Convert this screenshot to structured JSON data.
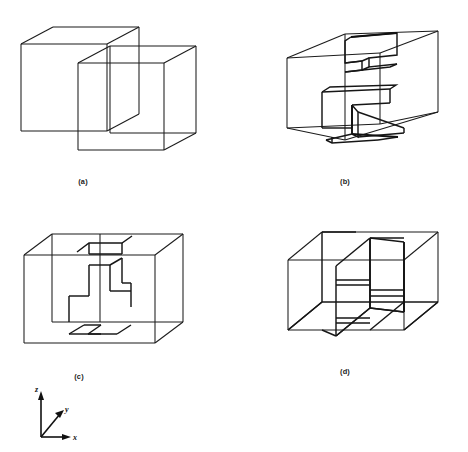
{
  "figure": {
    "background_color": "#ffffff",
    "ink_color": "#1b1b1b",
    "panel_count": 4,
    "layout": "2x2 grid of 3D wireframe box diagrams with a coordinate axis triad at lower left"
  },
  "panels": [
    {
      "id": "a",
      "caption": "(a)",
      "caption_x": 83,
      "caption_y": 184,
      "description": "Two interpenetrating wireframe boxes of equal size, offset diagonally so they overlap"
    },
    {
      "id": "b",
      "caption": "(b)",
      "caption_x": 345,
      "caption_y": 184,
      "description": "Wireframe box seen in oblique view containing a folded zigzag slab partition with visible thickness"
    },
    {
      "id": "c",
      "caption": "(c)",
      "caption_x": 79,
      "caption_y": 379,
      "description": "Wireframe box with a zigzag staircase partition on the front face and a second zigzag on the floor"
    },
    {
      "id": "d",
      "caption": "(d)",
      "caption_x": 345,
      "caption_y": 374,
      "description": "Wireframe box subdivided by two vertical partition planes and short horizontal shelves"
    }
  ],
  "axes": {
    "name": "coordinate-triad",
    "origin_x": 41,
    "origin_y": 437,
    "labels": {
      "x": "x",
      "y": "y",
      "z": "z"
    },
    "x_label_pos": [
      70,
      437
    ],
    "y_label_pos": [
      65,
      409
    ],
    "z_label_pos": [
      38,
      392
    ]
  }
}
